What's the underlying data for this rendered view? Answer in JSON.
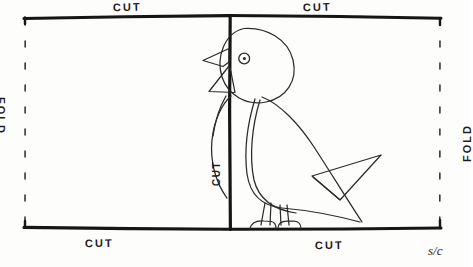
{
  "document": {
    "kind": "hand-drawn-craft-template",
    "title": "Fold and cut bird card template",
    "ink_color": "#1a1a1a",
    "paper_color": "#fdfdfc"
  },
  "labels": {
    "cut_top_left": "CUT",
    "cut_top_right": "CUT",
    "cut_bottom_left": "CUT",
    "cut_bottom_right": "CUT",
    "cut_center_vertical": "CUT",
    "fold_left": "FOLD",
    "fold_right": "FOLD",
    "signature": "s/c"
  },
  "figure": {
    "parts": [
      "head",
      "eye",
      "upper-beak",
      "lower-beak",
      "breast",
      "body",
      "wing",
      "tail",
      "left-leg",
      "right-leg",
      "left-foot",
      "right-foot"
    ]
  },
  "geometry": {
    "frame": {
      "left": 24,
      "right": 440,
      "top": 16,
      "bottom": 228
    },
    "center_cut_x": 230,
    "fold_dash_left_x": 25,
    "fold_dash_right_x": 440
  }
}
